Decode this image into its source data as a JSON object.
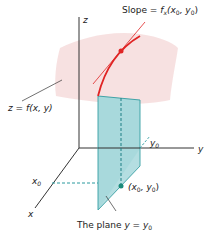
{
  "diagram": {
    "labels": {
      "slope_prefix": "Slope = ",
      "slope_f": "f",
      "slope_sub": "x",
      "slope_args_open": "(x",
      "slope_args_sep": ", y",
      "slope_args_close": ")",
      "surface_label": "z = f(x, y)",
      "z_axis": "z",
      "y_axis": "y",
      "x_axis": "x",
      "y0": "y",
      "x0": "x",
      "sub0": "0",
      "point_open": "(x",
      "point_sep": ", y",
      "point_close": ")",
      "plane_prefix": "The plane ",
      "plane_eq": "y = y"
    },
    "colors": {
      "surface": "#f6dede",
      "plane_fill": "#a7d9dc",
      "plane_edge": "#2a9a9e",
      "curve": "#e02424",
      "axis": "#333333",
      "point": "#1a8a7a"
    }
  }
}
